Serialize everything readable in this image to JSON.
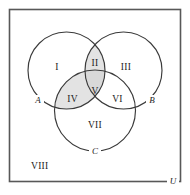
{
  "figure": {
    "background_color": "#ffffff",
    "frame_color": "#585858",
    "outline_color": "#3a3a3a",
    "shade_color": "#e3e3e3",
    "text_color": "#1c1c1c"
  },
  "sets": {
    "a_label": "A",
    "b_label": "B",
    "c_label": "C",
    "universal_label": "U"
  },
  "regions": [
    {
      "id": "I",
      "label": "I",
      "shaded": false,
      "meaning": "A only"
    },
    {
      "id": "II",
      "label": "II",
      "shaded": true,
      "meaning": "A and B, not C"
    },
    {
      "id": "III",
      "label": "III",
      "shaded": false,
      "meaning": "B only"
    },
    {
      "id": "IV",
      "label": "IV",
      "shaded": true,
      "meaning": "A and C, not B"
    },
    {
      "id": "V",
      "label": "V",
      "shaded": true,
      "meaning": "A and B and C"
    },
    {
      "id": "VI",
      "label": "VI",
      "shaded": false,
      "meaning": "B and C, not A"
    },
    {
      "id": "VII",
      "label": "VII",
      "shaded": false,
      "meaning": "C only"
    },
    {
      "id": "VIII",
      "label": "VIII",
      "shaded": false,
      "meaning": "outside all sets"
    }
  ],
  "labels": {
    "region_1": "I",
    "region_2": "II",
    "region_3": "III",
    "region_4": "IV",
    "region_5": "V",
    "region_6": "VI",
    "region_7": "VII",
    "region_8": "VIII"
  }
}
